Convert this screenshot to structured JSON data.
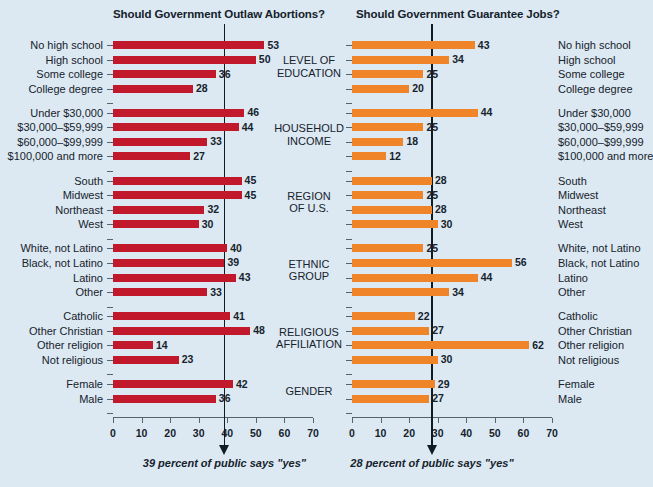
{
  "background_color": "#dce9f2",
  "charts": {
    "left": {
      "title": "Should Government Outlaw Abortions?",
      "color": "#c2182b",
      "caption": "39 percent of public says \"yes\"",
      "mean": 39
    },
    "right": {
      "title": "Should Government Guarantee Jobs?",
      "color": "#ef8429",
      "caption": "28 percent of public says \"yes\"",
      "mean": 28
    }
  },
  "axis": {
    "ticks": [
      0,
      10,
      20,
      30,
      40,
      50,
      60,
      70
    ],
    "min": 0,
    "max": 70
  },
  "groups": [
    {
      "name_line1": "LEVEL OF",
      "name_line2": "EDUCATION"
    },
    {
      "name_line1": "HOUSEHOLD",
      "name_line2": "INCOME"
    },
    {
      "name_line1": "REGION",
      "name_line2": "OF U.S."
    },
    {
      "name_line1": "ETHNIC",
      "name_line2": "GROUP"
    },
    {
      "name_line1": "RELIGIOUS",
      "name_line2": "AFFILIATION"
    },
    {
      "name_line1": "GENDER",
      "name_line2": ""
    }
  ],
  "chart_data": {
    "type": "bar",
    "orientation": "horizontal",
    "xlabel": "Percent saying \"yes\"",
    "ylabel": "",
    "xlim": [
      0,
      70
    ],
    "xticks": [
      0,
      10,
      20,
      30,
      40,
      50,
      60,
      70
    ],
    "grid": false,
    "legend": "none",
    "categories": [
      "No high school",
      "High school",
      "Some college",
      "College degree",
      "Under $30,000",
      "$30,000–$59,999",
      "$60,000–$99,999",
      "$100,000 and more",
      "South",
      "Midwest",
      "Northeast",
      "West",
      "White, not Latino",
      "Black, not Latino",
      "Latino",
      "Other",
      "Catholic",
      "Other Christian",
      "Other religion",
      "Not religious",
      "Female",
      "Male"
    ],
    "group_breaks": [
      4,
      8,
      12,
      16,
      20
    ],
    "series": [
      {
        "name": "Should Government Outlaw Abortions?",
        "color": "#c2182b",
        "mean": 39,
        "mean_note": "39 percent of public says \"yes\"",
        "values": [
          53,
          50,
          36,
          28,
          46,
          44,
          33,
          27,
          45,
          45,
          32,
          30,
          40,
          39,
          43,
          33,
          41,
          48,
          14,
          23,
          42,
          36
        ]
      },
      {
        "name": "Should Government Guarantee Jobs?",
        "color": "#ef8429",
        "mean": 28,
        "mean_note": "28 percent of public says \"yes\"",
        "values": [
          43,
          34,
          25,
          20,
          44,
          25,
          18,
          12,
          28,
          25,
          28,
          30,
          25,
          56,
          44,
          34,
          22,
          27,
          62,
          30,
          29,
          27
        ]
      }
    ]
  }
}
